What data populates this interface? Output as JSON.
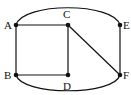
{
  "diagram": {
    "type": "graph",
    "nodes": [
      {
        "id": "A",
        "label": "A",
        "x": 16,
        "y": 25
      },
      {
        "id": "B",
        "label": "B",
        "x": 16,
        "y": 75
      },
      {
        "id": "C",
        "label": "C",
        "x": 68,
        "y": 25
      },
      {
        "id": "D",
        "label": "D",
        "x": 68,
        "y": 75
      },
      {
        "id": "E",
        "label": "E",
        "x": 120,
        "y": 25
      },
      {
        "id": "F",
        "label": "F",
        "x": 120,
        "y": 75
      }
    ],
    "edges": [
      {
        "from": "A",
        "to": "C",
        "shape": "straight"
      },
      {
        "from": "A",
        "to": "B",
        "shape": "straight"
      },
      {
        "from": "B",
        "to": "D",
        "shape": "straight"
      },
      {
        "from": "C",
        "to": "D",
        "shape": "straight"
      },
      {
        "from": "C",
        "to": "F",
        "shape": "straight"
      },
      {
        "from": "E",
        "to": "F",
        "shape": "straight"
      },
      {
        "from": "A",
        "to": "E",
        "shape": "arc-top"
      },
      {
        "from": "B",
        "to": "F",
        "shape": "arc-bottom"
      }
    ]
  }
}
